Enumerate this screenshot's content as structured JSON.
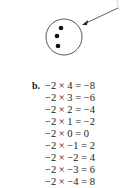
{
  "figure": {
    "circle": {
      "dots": 3
    },
    "arrow": {
      "direction": "from upper-right into circle"
    }
  },
  "part_b": {
    "label": "b.",
    "equations": [
      "−2 × 4 = −8",
      "−2 × 3 = −6",
      "−2 × 2 = −4",
      "−2 × 1 = −2",
      "−2 × 0 = 0",
      "−2 × −1 = 2",
      "−2 × −2 = 4",
      "−2 × −3 = 6",
      "−2 × −4 = 8"
    ]
  }
}
